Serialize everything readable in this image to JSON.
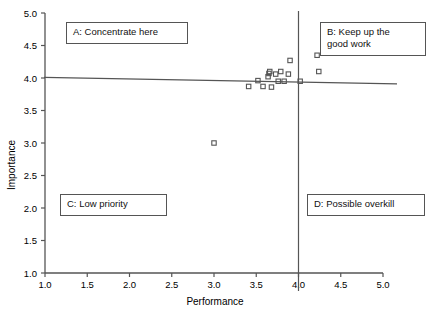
{
  "chart_data": {
    "type": "scatter",
    "title": "",
    "xlabel": "Performance",
    "ylabel": "Importance",
    "xlim": [
      1.0,
      5.0
    ],
    "ylim": [
      1.0,
      5.0
    ],
    "xticks": [
      "1.0",
      "1.5",
      "2.0",
      "2.5",
      "3.0",
      "3.5",
      "4.0",
      "4.5",
      "5.0"
    ],
    "yticks": [
      "1.0",
      "1.5",
      "2.0",
      "2.5",
      "3.0",
      "3.5",
      "4.0",
      "4.5",
      "5.0"
    ],
    "xtick_values": [
      1.0,
      1.5,
      2.0,
      2.5,
      3.0,
      3.5,
      4.0,
      4.5,
      5.0
    ],
    "ytick_values": [
      1.0,
      1.5,
      2.0,
      2.5,
      3.0,
      3.5,
      4.0,
      4.5,
      5.0
    ],
    "grid": false,
    "legend": "none",
    "marker": "open-square",
    "points": [
      {
        "x": 3.0,
        "y": 3.0
      },
      {
        "x": 3.41,
        "y": 3.87
      },
      {
        "x": 3.52,
        "y": 3.96
      },
      {
        "x": 3.58,
        "y": 3.87
      },
      {
        "x": 3.64,
        "y": 4.02
      },
      {
        "x": 3.65,
        "y": 4.07
      },
      {
        "x": 3.66,
        "y": 4.1
      },
      {
        "x": 3.68,
        "y": 3.86
      },
      {
        "x": 3.73,
        "y": 4.06
      },
      {
        "x": 3.76,
        "y": 3.95
      },
      {
        "x": 3.79,
        "y": 4.1
      },
      {
        "x": 3.83,
        "y": 3.95
      },
      {
        "x": 3.88,
        "y": 4.06
      },
      {
        "x": 3.9,
        "y": 4.27
      },
      {
        "x": 4.02,
        "y": 3.95
      },
      {
        "x": 4.22,
        "y": 4.35
      },
      {
        "x": 4.24,
        "y": 4.1
      }
    ],
    "reference_lines": {
      "vertical": {
        "x": 4.0,
        "label": "performance-mean"
      },
      "horizontal": {
        "y_left": 4.01,
        "y_right": 3.91,
        "label": "importance-mean"
      }
    },
    "quadrants": [
      {
        "id": "A",
        "label": "A: Concentrate here"
      },
      {
        "id": "B",
        "label": "B: Keep up the\ngood work"
      },
      {
        "id": "C",
        "label": "C: Low priority"
      },
      {
        "id": "D",
        "label": "D: Possible overkill"
      }
    ]
  },
  "colors": {
    "axis": "#555555",
    "marker_edge": "#555555",
    "text": "#111111",
    "background": "#ffffff"
  }
}
